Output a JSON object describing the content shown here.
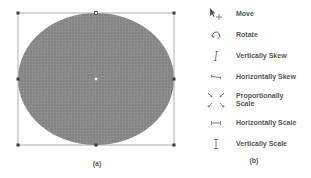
{
  "figure": {
    "panel_a": {
      "caption": "(a)",
      "shape": "ellipse",
      "fill_color": "#8a8a8a",
      "bounding_box_color": "#888888",
      "handle_color": "#444444",
      "center_marker_color": "#ffffff"
    },
    "panel_b": {
      "caption": "(b)",
      "items": [
        {
          "icon": "move-cursor-icon",
          "label": "Move"
        },
        {
          "icon": "rotate-cursor-icon",
          "label": "Rotate"
        },
        {
          "icon": "vertical-skew-cursor-icon",
          "label": "Vertically Skew"
        },
        {
          "icon": "horizontal-skew-cursor-icon",
          "label": "Horizontally Skew"
        },
        {
          "icon": "proportional-scale-cursor-icon",
          "label": "Proportionally Scale"
        },
        {
          "icon": "horizontal-scale-cursor-icon",
          "label": "Horizontally Scale"
        },
        {
          "icon": "vertical-scale-cursor-icon",
          "label": "Vertically Scale"
        }
      ]
    }
  }
}
